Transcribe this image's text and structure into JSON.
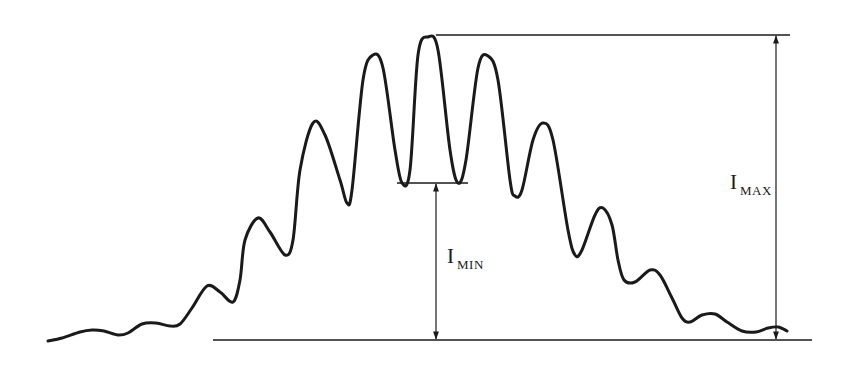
{
  "diagram": {
    "title": "",
    "colors": {
      "line": "#1a1a1a",
      "background": "#ffffff"
    },
    "labels": {
      "i_max": {
        "main": "I",
        "sub": "MAX"
      },
      "i_min": {
        "main": "I",
        "sub": "MIN"
      }
    },
    "curve_points": [
      [
        48,
        341
      ],
      [
        62,
        338
      ],
      [
        80,
        332
      ],
      [
        92,
        330
      ],
      [
        104,
        331
      ],
      [
        118,
        335
      ],
      [
        128,
        333
      ],
      [
        142,
        324
      ],
      [
        156,
        323
      ],
      [
        170,
        326
      ],
      [
        180,
        324
      ],
      [
        192,
        308
      ],
      [
        207,
        286
      ],
      [
        220,
        292
      ],
      [
        233,
        302
      ],
      [
        240,
        280
      ],
      [
        245,
        240
      ],
      [
        258,
        218
      ],
      [
        270,
        232
      ],
      [
        285,
        255
      ],
      [
        293,
        240
      ],
      [
        300,
        170
      ],
      [
        313,
        123
      ],
      [
        325,
        135
      ],
      [
        340,
        180
      ],
      [
        347,
        203
      ],
      [
        352,
        190
      ],
      [
        363,
        80
      ],
      [
        373,
        55
      ],
      [
        383,
        68
      ],
      [
        395,
        150
      ],
      [
        402,
        183
      ],
      [
        410,
        170
      ],
      [
        418,
        55
      ],
      [
        428,
        37
      ],
      [
        438,
        50
      ],
      [
        450,
        150
      ],
      [
        458,
        183
      ],
      [
        466,
        160
      ],
      [
        478,
        68
      ],
      [
        488,
        56
      ],
      [
        498,
        80
      ],
      [
        510,
        180
      ],
      [
        515,
        196
      ],
      [
        522,
        190
      ],
      [
        533,
        140
      ],
      [
        543,
        123
      ],
      [
        553,
        140
      ],
      [
        568,
        230
      ],
      [
        575,
        255
      ],
      [
        582,
        250
      ],
      [
        595,
        215
      ],
      [
        603,
        208
      ],
      [
        612,
        225
      ],
      [
        618,
        260
      ],
      [
        624,
        280
      ],
      [
        635,
        282
      ],
      [
        650,
        270
      ],
      [
        660,
        275
      ],
      [
        672,
        298
      ],
      [
        682,
        318
      ],
      [
        690,
        322
      ],
      [
        702,
        315
      ],
      [
        715,
        314
      ],
      [
        727,
        322
      ],
      [
        742,
        331
      ],
      [
        756,
        332
      ],
      [
        768,
        328
      ],
      [
        778,
        327
      ],
      [
        787,
        331
      ]
    ],
    "baseline": {
      "x1": 213,
      "x2": 812,
      "y": 340
    },
    "max_line": {
      "x1": 436,
      "x2": 790,
      "y": 35
    },
    "min_line": {
      "x1": 397,
      "x2": 468,
      "y": 183
    },
    "max_arrow": {
      "x": 776,
      "y_top": 35,
      "y_bottom": 340
    },
    "min_arrow": {
      "x": 436,
      "y_top": 183,
      "y_bottom": 340
    }
  }
}
